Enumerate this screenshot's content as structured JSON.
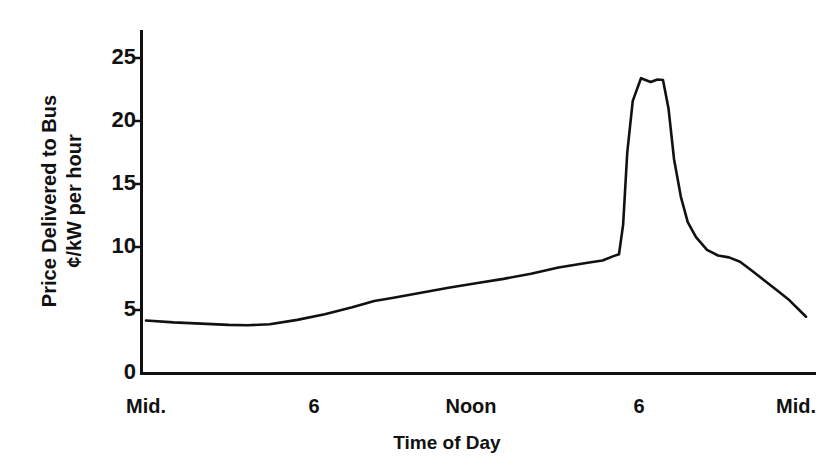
{
  "chart_data": {
    "type": "line",
    "title": "",
    "xlabel": "Time of Day",
    "ylabel": "Price Delivered to Bus ¢/kW per hour",
    "ylabel_lines": [
      "Price Delivered to Bus",
      "¢/kW per hour"
    ],
    "yticks": [
      0,
      5,
      10,
      15,
      20,
      25
    ],
    "ytick_labels": [
      "0",
      "5",
      "10",
      "15",
      "20",
      "25"
    ],
    "ylim": [
      0,
      26.5
    ],
    "xticks": [
      0,
      6,
      12,
      18,
      24
    ],
    "xtick_labels": [
      "Mid.",
      "6",
      "Noon",
      "6",
      "Mid."
    ],
    "xlim": [
      0,
      24
    ],
    "grid": false,
    "legend": null,
    "line_color": "#111111",
    "axis_color": "#111111",
    "series": [
      {
        "name": "Price delivered to bus",
        "x": [
          0.0,
          1.0,
          2.0,
          3.0,
          3.7,
          4.5,
          5.5,
          6.5,
          7.5,
          8.3,
          9.0,
          10.0,
          11.0,
          12.0,
          13.0,
          14.0,
          15.0,
          16.0,
          16.6,
          17.0,
          17.2,
          17.35,
          17.5,
          17.7,
          18.0,
          18.35,
          18.6,
          18.8,
          19.0,
          19.2,
          19.45,
          19.7,
          20.0,
          20.4,
          20.8,
          21.2,
          21.6,
          22.0,
          22.5,
          23.0,
          23.4,
          24.0
        ],
        "y": [
          4.2,
          4.05,
          3.95,
          3.85,
          3.82,
          3.9,
          4.25,
          4.7,
          5.25,
          5.75,
          6.0,
          6.4,
          6.8,
          7.15,
          7.5,
          7.9,
          8.4,
          8.75,
          8.95,
          9.3,
          9.45,
          11.8,
          17.5,
          21.6,
          23.4,
          23.1,
          23.3,
          23.25,
          21.0,
          17.0,
          14.0,
          12.0,
          10.8,
          9.8,
          9.35,
          9.2,
          8.85,
          8.2,
          7.35,
          6.5,
          5.8,
          4.5
        ]
      }
    ]
  },
  "axes": {
    "y_axis_name": "y-axis",
    "x_axis_name": "x-axis"
  }
}
